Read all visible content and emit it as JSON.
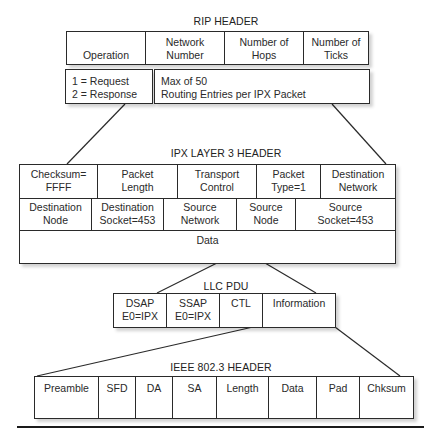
{
  "rip": {
    "title": "RIP HEADER",
    "fields": [
      {
        "line1": "",
        "line2": "Operation"
      },
      {
        "line1": "Network",
        "line2": "Number"
      },
      {
        "line1": "Number of",
        "line2": "Hops"
      },
      {
        "line1": "Number of",
        "line2": "Ticks"
      }
    ],
    "detail": [
      {
        "line1": "1  =  Request",
        "line2": "2  =  Response"
      },
      {
        "line1": "Max of 50",
        "line2": "Routing Entries per IPX Packet"
      }
    ]
  },
  "ipx": {
    "title": "IPX LAYER 3 HEADER",
    "row1": [
      {
        "line1": "Checksum=",
        "line2": "FFFF"
      },
      {
        "line1": "Packet",
        "line2": "Length"
      },
      {
        "line1": "Transport",
        "line2": "Control"
      },
      {
        "line1": "Packet",
        "line2": "Type=1"
      },
      {
        "line1": "Destination",
        "line2": "Network"
      }
    ],
    "row2": [
      {
        "line1": "Destination",
        "line2": "Node"
      },
      {
        "line1": "Destination",
        "line2": "Socket=453"
      },
      {
        "line1": "Source",
        "line2": "Network"
      },
      {
        "line1": "Source",
        "line2": "Node"
      },
      {
        "line1": "Source",
        "line2": "Socket=453"
      }
    ],
    "data_label": "Data"
  },
  "llc": {
    "title": "LLC PDU",
    "fields": [
      {
        "line1": "DSAP",
        "line2": "E0=IPX"
      },
      {
        "line1": "SSAP",
        "line2": "E0=IPX"
      },
      {
        "line1": "CTL",
        "line2": ""
      },
      {
        "line1": "Information",
        "line2": ""
      }
    ]
  },
  "ieee": {
    "title": "IEEE 802.3 HEADER",
    "fields": [
      "Preamble",
      "SFD",
      "DA",
      "SA",
      "Length",
      "Data",
      "Pad",
      "Chksum"
    ]
  },
  "colors": {
    "line": "#2a2a2a",
    "background": "#ffffff",
    "shadow": "#d0d0d0"
  }
}
